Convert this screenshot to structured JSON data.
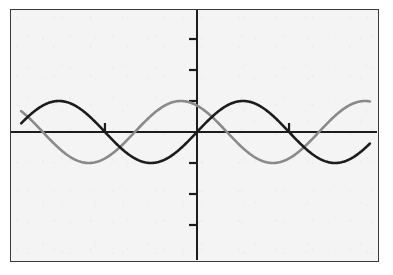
{
  "screen": {
    "width": 393,
    "height": 275,
    "background_color": "#ffffff",
    "plot_background_color": "#f4f4f4",
    "border_color": "#3a3a3c"
  },
  "chart_data": {
    "type": "line",
    "title": "",
    "subtitle": "",
    "xlabel": "",
    "ylabel": "",
    "grid": false,
    "legend_position": "none",
    "axis_style": "centered-cross",
    "xlim": [
      -6.0,
      5.9
    ],
    "ylim": [
      -4.25,
      4.0
    ],
    "x_tick_values": [
      -3.14159,
      3.14159
    ],
    "x_tick_labels": [
      "",
      ""
    ],
    "y_tick_values": [
      -3,
      -2,
      -1,
      1,
      2,
      3
    ],
    "y_tick_labels": [
      "",
      "",
      "",
      "",
      "",
      ""
    ],
    "x_tick_direction": "up",
    "y_tick_direction": "left",
    "series": [
      {
        "name": "dark-wave",
        "color": "#1c1c1e",
        "line_width": 2.6,
        "function": "sin(x)",
        "amplitude": 1.0,
        "period": 6.28319,
        "phase": 0.0,
        "x_start": -6.0,
        "x_end": 5.9,
        "samples": 480
      },
      {
        "name": "gray-wave",
        "color": "#8a8a8c",
        "line_width": 2.6,
        "function": "cos(x + 0.55)",
        "amplitude": 1.0,
        "period": 6.28319,
        "phase": 0.55,
        "x_start": -6.0,
        "x_end": 5.9,
        "samples": 480
      }
    ],
    "axes": {
      "x_axis_color": "#1c1c1e",
      "y_axis_color": "#1c1c1e",
      "x_axis_width": 2.0,
      "y_axis_width": 2.0,
      "origin_x_px": 197,
      "origin_y_px": 132,
      "unit_px_x": 29.3,
      "unit_px_y": 31.0
    }
  },
  "labels": {
    "frame": "graph-viewport",
    "x_axis": "horizontal-axis",
    "y_axis": "vertical-axis"
  }
}
